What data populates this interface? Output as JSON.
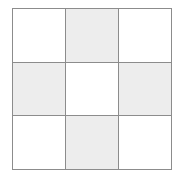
{
  "figure": {
    "name": "checkerboard-3x3",
    "rows": 3,
    "columns": 3,
    "colors": {
      "line": "#8c8c8c",
      "shaded_cell": "#ededed",
      "empty_cell": "#ffffff",
      "background": "#ffffff"
    },
    "line_width_px": 1,
    "grid_box": {
      "left": 12,
      "top": 8,
      "width": 160,
      "height": 162
    },
    "cells": [
      {
        "row": 0,
        "col": 0,
        "state": "empty",
        "label": ""
      },
      {
        "row": 0,
        "col": 1,
        "state": "shaded",
        "label": ""
      },
      {
        "row": 0,
        "col": 2,
        "state": "empty",
        "label": ""
      },
      {
        "row": 1,
        "col": 0,
        "state": "shaded",
        "label": ""
      },
      {
        "row": 1,
        "col": 1,
        "state": "empty",
        "label": ""
      },
      {
        "row": 1,
        "col": 2,
        "state": "shaded",
        "label": ""
      },
      {
        "row": 2,
        "col": 0,
        "state": "empty",
        "label": ""
      },
      {
        "row": 2,
        "col": 1,
        "state": "shaded",
        "label": ""
      },
      {
        "row": 2,
        "col": 2,
        "state": "empty",
        "label": ""
      }
    ]
  }
}
